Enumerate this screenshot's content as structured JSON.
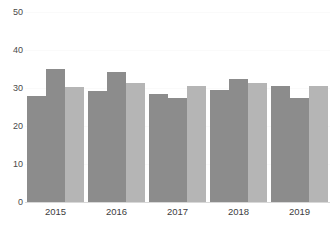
{
  "chart_data": {
    "type": "bar",
    "title": "",
    "subtitle": "",
    "xlabel": "",
    "ylabel": "",
    "categories": [
      "2015",
      "2016",
      "2017",
      "2018",
      "2019"
    ],
    "series": [
      {
        "name": "Series 1",
        "color": "#8c8c8c",
        "values": [
          28.0,
          29.3,
          28.4,
          29.5,
          30.5
        ]
      },
      {
        "name": "Series 2",
        "color": "#8c8c8c",
        "values": [
          35.0,
          34.1,
          27.4,
          32.3,
          27.5
        ]
      },
      {
        "name": "Series 3",
        "color": "#b5b5b5",
        "values": [
          30.2,
          31.3,
          30.4,
          31.4,
          30.5
        ]
      }
    ],
    "ylim": [
      0,
      50
    ],
    "yticks": [
      0,
      10,
      20,
      30,
      40,
      50
    ],
    "ytick_labels": [
      "0",
      "10",
      "20",
      "30",
      "40",
      "50"
    ],
    "grid": true,
    "grid_color": "#fafafa",
    "legend": false,
    "legend_position": "none",
    "axis_color": "#d8d8d8",
    "background": "#ffffff",
    "annotations": []
  }
}
